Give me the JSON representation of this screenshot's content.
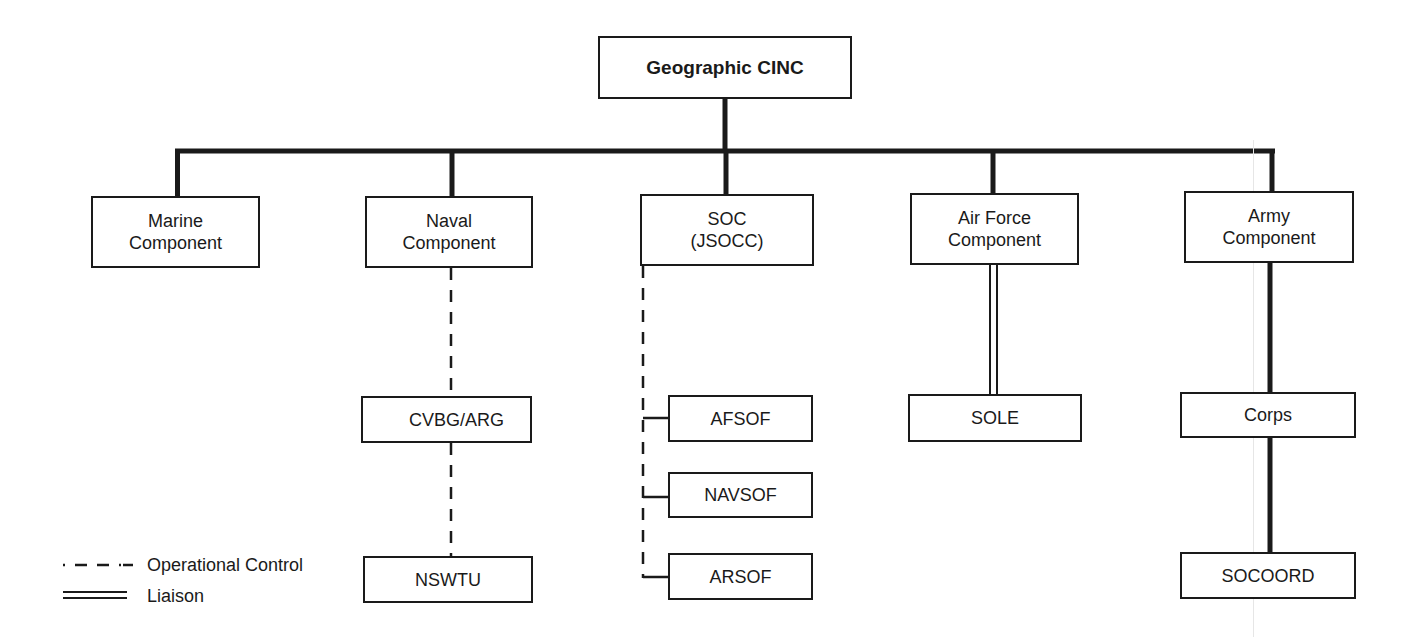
{
  "diagram": {
    "type": "organization-chart",
    "root": {
      "id": "cinc",
      "label": "Geographic CINC"
    },
    "components": [
      {
        "id": "marine",
        "label": "Marine\nComponent"
      },
      {
        "id": "naval",
        "label": "Naval\nComponent"
      },
      {
        "id": "soc",
        "label": "SOC\n(JSOCC)"
      },
      {
        "id": "airforce",
        "label": "Air Force\nComponent"
      },
      {
        "id": "army",
        "label": "Army\nComponent"
      }
    ],
    "subordinates": {
      "naval": [
        {
          "id": "cvbg",
          "label": "CVBG/ARG"
        },
        {
          "id": "nswtu",
          "label": "NSWTU"
        }
      ],
      "soc": [
        {
          "id": "afsof",
          "label": "AFSOF"
        },
        {
          "id": "navsof",
          "label": "NAVSOF"
        },
        {
          "id": "arsof",
          "label": "ARSOF"
        }
      ],
      "airforce": [
        {
          "id": "sole",
          "label": "SOLE"
        }
      ],
      "army": [
        {
          "id": "corps",
          "label": "Corps"
        },
        {
          "id": "socoord",
          "label": "SOCOORD"
        }
      ]
    },
    "edges": [
      {
        "from": "cinc",
        "to": "marine",
        "style": "command"
      },
      {
        "from": "cinc",
        "to": "naval",
        "style": "command"
      },
      {
        "from": "cinc",
        "to": "soc",
        "style": "command"
      },
      {
        "from": "cinc",
        "to": "airforce",
        "style": "command"
      },
      {
        "from": "cinc",
        "to": "army",
        "style": "command"
      },
      {
        "from": "naval",
        "to": "cvbg",
        "style": "operational-control"
      },
      {
        "from": "cvbg",
        "to": "nswtu",
        "style": "operational-control"
      },
      {
        "from": "soc",
        "to": "afsof",
        "style": "operational-control"
      },
      {
        "from": "soc",
        "to": "navsof",
        "style": "operational-control"
      },
      {
        "from": "soc",
        "to": "arsof",
        "style": "operational-control"
      },
      {
        "from": "airforce",
        "to": "sole",
        "style": "liaison"
      },
      {
        "from": "army",
        "to": "corps",
        "style": "command"
      },
      {
        "from": "corps",
        "to": "socoord",
        "style": "command"
      }
    ],
    "legend": [
      {
        "style": "operational-control",
        "label": "Operational Control"
      },
      {
        "style": "liaison",
        "label": "Liaison"
      }
    ],
    "colors": {
      "line": "#1a1a1a",
      "background": "#ffffff"
    }
  }
}
